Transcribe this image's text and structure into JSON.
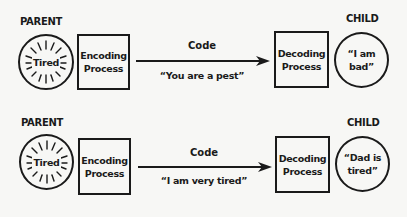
{
  "rows": [
    {
      "parent_label": "PARENT",
      "parent_state": "Tired",
      "encoding_label": "Encoding Process",
      "channel_label": "Code",
      "message": "“You are a pest”",
      "decoding_label": "Decoding Process",
      "child_label": "CHILD",
      "child_interpretation": "“I am bad”"
    },
    {
      "parent_label": "PARENT",
      "parent_state": "Tired",
      "encoding_label": "Encoding Process",
      "channel_label": "Code",
      "message": "“I am very tired”",
      "decoding_label": "Decoding Process",
      "child_label": "CHILD",
      "child_interpretation": "“Dad is tired”"
    }
  ],
  "colors": {
    "ink": "#1a1a1a",
    "background": "#f7f7f5"
  }
}
